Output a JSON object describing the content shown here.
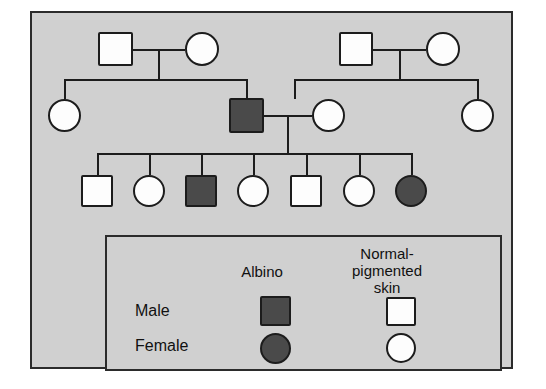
{
  "figure": {
    "type": "pedigree-chart",
    "title": "",
    "trait": "Albinism",
    "background_color": "#d0d0d0",
    "frame_color": "#2b2b2b",
    "affected_fill": "#4a4a4a",
    "unaffected_fill": "#fdfdfd",
    "line_color": "#1c1c1c"
  },
  "legend": {
    "columns": [
      {
        "key": "albino",
        "label": "Albino"
      },
      {
        "key": "normal",
        "label": "Normal-\npigmented\nskin"
      }
    ],
    "rows": [
      {
        "key": "male",
        "label": "Male",
        "shape": "square"
      },
      {
        "key": "female",
        "label": "Female",
        "shape": "circle"
      }
    ],
    "swatches": [
      {
        "row": "male",
        "column": "albino",
        "shape": "square",
        "status": "affected"
      },
      {
        "row": "male",
        "column": "normal",
        "shape": "square",
        "status": "unaffected"
      },
      {
        "row": "female",
        "column": "albino",
        "shape": "circle",
        "status": "affected"
      },
      {
        "row": "female",
        "column": "normal",
        "shape": "circle",
        "status": "unaffected"
      }
    ]
  },
  "pedigree": {
    "generations": [
      {
        "id": "I",
        "individuals": [
          {
            "id": "I-1",
            "sex": "male",
            "shape": "square",
            "status": "unaffected"
          },
          {
            "id": "I-2",
            "sex": "female",
            "shape": "circle",
            "status": "unaffected"
          },
          {
            "id": "I-3",
            "sex": "male",
            "shape": "square",
            "status": "unaffected"
          },
          {
            "id": "I-4",
            "sex": "female",
            "shape": "circle",
            "status": "unaffected"
          }
        ]
      },
      {
        "id": "II",
        "individuals": [
          {
            "id": "II-1",
            "sex": "female",
            "shape": "circle",
            "status": "unaffected"
          },
          {
            "id": "II-2",
            "sex": "male",
            "shape": "square",
            "status": "affected"
          },
          {
            "id": "II-3",
            "sex": "female",
            "shape": "circle",
            "status": "unaffected"
          },
          {
            "id": "II-4",
            "sex": "female",
            "shape": "circle",
            "status": "unaffected"
          }
        ]
      },
      {
        "id": "III",
        "individuals": [
          {
            "id": "III-1",
            "sex": "male",
            "shape": "square",
            "status": "unaffected"
          },
          {
            "id": "III-2",
            "sex": "female",
            "shape": "circle",
            "status": "unaffected"
          },
          {
            "id": "III-3",
            "sex": "male",
            "shape": "square",
            "status": "affected"
          },
          {
            "id": "III-4",
            "sex": "female",
            "shape": "circle",
            "status": "unaffected"
          },
          {
            "id": "III-5",
            "sex": "male",
            "shape": "square",
            "status": "unaffected"
          },
          {
            "id": "III-6",
            "sex": "female",
            "shape": "circle",
            "status": "unaffected"
          },
          {
            "id": "III-7",
            "sex": "female",
            "shape": "circle",
            "status": "affected"
          }
        ]
      }
    ],
    "matings": [
      {
        "id": "mating-1",
        "partners": [
          "I-1",
          "I-2"
        ],
        "children": [
          "II-1",
          "II-2"
        ]
      },
      {
        "id": "mating-2",
        "partners": [
          "I-3",
          "I-4"
        ],
        "children": [
          "II-3",
          "II-4"
        ]
      },
      {
        "id": "mating-3",
        "partners": [
          "II-2",
          "II-3"
        ],
        "children": [
          "III-1",
          "III-2",
          "III-3",
          "III-4",
          "III-5",
          "III-6",
          "III-7"
        ]
      }
    ]
  }
}
